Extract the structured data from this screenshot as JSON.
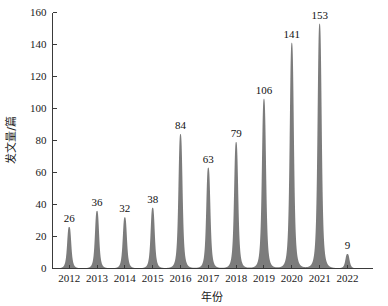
{
  "chart_data": {
    "type": "area",
    "title": "",
    "subtitle": "",
    "xlabel": "年份",
    "ylabel": "发文量/篇",
    "categories": [
      "2012",
      "2013",
      "2014",
      "2015",
      "2016",
      "2017",
      "2018",
      "2019",
      "2020",
      "2021",
      "2022"
    ],
    "values": [
      26,
      36,
      32,
      38,
      84,
      63,
      79,
      106,
      141,
      153,
      9
    ],
    "data_labels": [
      "26",
      "36",
      "32",
      "38",
      "84",
      "63",
      "79",
      "106",
      "141",
      "153",
      "9"
    ],
    "series": [
      {
        "name": "发文量",
        "values": [
          26,
          36,
          32,
          38,
          84,
          63,
          79,
          106,
          141,
          153,
          9
        ]
      }
    ],
    "xlim": [
      2011.4,
      2022.9
    ],
    "ylim": [
      0,
      160
    ],
    "ytick_labels": [
      "0",
      "20",
      "40",
      "60",
      "80",
      "100",
      "120",
      "140",
      "160"
    ],
    "ytick_values": [
      0,
      20,
      40,
      60,
      80,
      100,
      120,
      140,
      160
    ],
    "xtick_labels": [
      "2012",
      "2013",
      "2014",
      "2015",
      "2016",
      "2017",
      "2018",
      "2019",
      "2020",
      "2021",
      "2022"
    ],
    "grid": false,
    "legend": false,
    "legend_position": "none",
    "fill_color": "#7c7c7c",
    "axis_color": "#3a3a3a",
    "background_color": "#ffffff",
    "annotations": []
  },
  "axes": {
    "y_title": "发文量/篇",
    "x_title": "年份"
  }
}
